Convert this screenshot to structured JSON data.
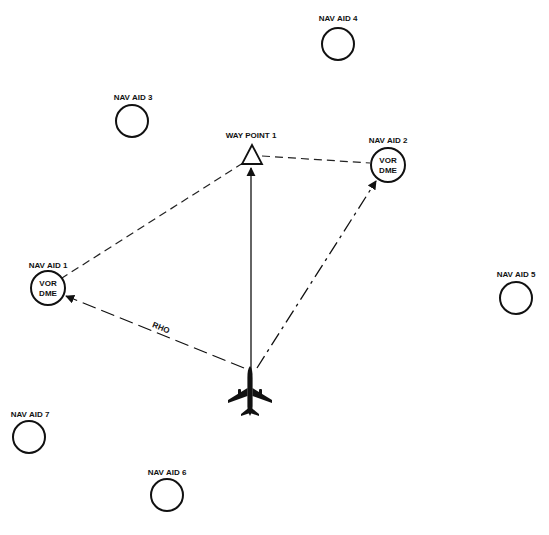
{
  "diagram": {
    "nav_aids": [
      {
        "id": "nav1",
        "label": "NAV AID 1",
        "inner": [
          "VOR",
          "DME"
        ],
        "cx": 48,
        "cy": 288,
        "r": 17
      },
      {
        "id": "nav2",
        "label": "NAV AID 2",
        "inner": [
          "VOR",
          "DME"
        ],
        "cx": 388,
        "cy": 165,
        "r": 17
      },
      {
        "id": "nav3",
        "label": "NAV AID 3",
        "inner": [],
        "cx": 132,
        "cy": 121,
        "r": 16
      },
      {
        "id": "nav4",
        "label": "NAV AID 4",
        "inner": [],
        "cx": 338,
        "cy": 44,
        "r": 16
      },
      {
        "id": "nav5",
        "label": "NAV AID 5",
        "inner": [],
        "cx": 516,
        "cy": 298,
        "r": 16
      },
      {
        "id": "nav6",
        "label": "NAV AID 6",
        "inner": [],
        "cx": 167,
        "cy": 495,
        "r": 16
      },
      {
        "id": "nav7",
        "label": "NAV AID 7",
        "inner": [],
        "cx": 29,
        "cy": 437,
        "r": 16
      }
    ],
    "waypoint": {
      "label": "WAY POINT 1",
      "x": 252,
      "y": 155
    },
    "aircraft": {
      "label": "aircraft",
      "x": 250,
      "y": 392
    },
    "path_labels": {
      "rho": "RHO"
    }
  }
}
